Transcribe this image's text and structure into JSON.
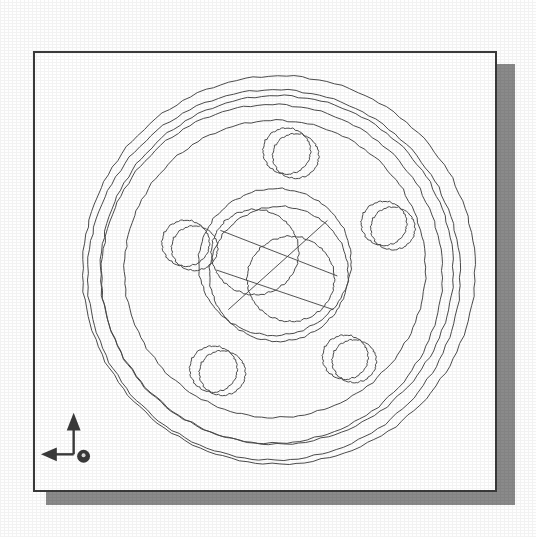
{
  "viewport": {
    "background_color": "#fefefe",
    "paper_color": "#ffffff",
    "border_color": "#3a3a3a",
    "shadow_color": "#8a8a8a",
    "line_color": "#4a4a4a",
    "title": "",
    "paper": {
      "x": 33,
      "y": 51,
      "width": 464,
      "height": 441
    },
    "shadow_offset": {
      "x": 13,
      "y": 13
    }
  },
  "ucs_icon": {
    "name": "ucs-axis-indicator",
    "origin_label": "",
    "y_axis_label": "",
    "x_axis_label": "",
    "z_axis_label": "",
    "arrow_color": "#3a3a3a",
    "up_arrow": "Y",
    "left_arrow": "X",
    "origin_marker": "Z"
  },
  "model": {
    "name": "wheel-hub-flange",
    "view": "isometric-wireframe",
    "center": {
      "x": 280,
      "y": 272
    },
    "rim_circles": [
      {
        "name": "outer-rim-front",
        "cx": 281,
        "cy": 272,
        "rx": 198,
        "ry": 196,
        "rot": -4
      },
      {
        "name": "outer-rim-back",
        "cx": 276,
        "cy": 277,
        "rx": 188,
        "ry": 187,
        "rot": -4
      },
      {
        "name": "rim-shoulder-a",
        "cx": 279,
        "cy": 272,
        "rx": 178,
        "ry": 176,
        "rot": -6
      },
      {
        "name": "rim-shoulder-b",
        "cx": 274,
        "cy": 276,
        "rx": 172,
        "ry": 171,
        "rot": -6
      },
      {
        "name": "flange-face",
        "cx": 277,
        "cy": 271,
        "rx": 152,
        "ry": 150,
        "rot": -8
      }
    ],
    "hub_circles": [
      {
        "name": "hub-boss-outer",
        "cx": 277,
        "cy": 264,
        "rx": 77,
        "ry": 74,
        "rot": -10
      },
      {
        "name": "hub-boss-inner",
        "cx": 281,
        "cy": 276,
        "rx": 70,
        "ry": 68,
        "rot": -10
      },
      {
        "name": "bore-top",
        "cx": 257,
        "cy": 254,
        "rx": 44,
        "ry": 43,
        "rot": 0
      },
      {
        "name": "bore-bottom",
        "cx": 293,
        "cy": 281,
        "rx": 44,
        "ry": 43,
        "rot": 0
      }
    ],
    "bolt_holes": [
      {
        "name": "bolt-hole-top",
        "cx": 289,
        "cy": 152,
        "r": 24,
        "offset_x": 9,
        "offset_y": 5
      },
      {
        "name": "bolt-hole-right",
        "cx": 387,
        "cy": 225,
        "r": 23,
        "offset_x": 9,
        "offset_y": 5
      },
      {
        "name": "bolt-hole-left",
        "cx": 187,
        "cy": 245,
        "r": 24,
        "offset_x": 9,
        "offset_y": 5
      },
      {
        "name": "bolt-hole-lower-left",
        "cx": 215,
        "cy": 372,
        "r": 24,
        "offset_x": 9,
        "offset_y": 4
      },
      {
        "name": "bolt-hole-lower-right",
        "cx": 348,
        "cy": 360,
        "r": 23,
        "offset_x": 9,
        "offset_y": 4
      }
    ],
    "construction_lines": [
      {
        "name": "hub-chord-a",
        "x1": 222,
        "y1": 232,
        "x2": 340,
        "y2": 278
      },
      {
        "name": "hub-chord-b",
        "x1": 230,
        "y1": 312,
        "x2": 330,
        "y2": 222
      },
      {
        "name": "hub-chord-c",
        "x1": 218,
        "y1": 272,
        "x2": 336,
        "y2": 312
      }
    ]
  }
}
